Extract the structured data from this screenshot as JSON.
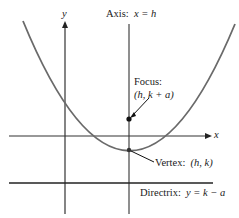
{
  "diagram": {
    "type": "parabola-labeled",
    "axes": {
      "x_label": "x",
      "y_label": "y"
    },
    "axis_of_symmetry": {
      "prefix": "Axis:",
      "equation": "x = h"
    },
    "focus": {
      "title": "Focus:",
      "coords": "(h, k + a)"
    },
    "vertex": {
      "prefix": "Vertex:",
      "coords": "(h, k)"
    },
    "directrix": {
      "prefix": "Directrix:",
      "equation": "y = k − a"
    },
    "colors": {
      "curve": "#6a6a6a",
      "lines": "#333333",
      "text": "#1a1a1a"
    }
  }
}
